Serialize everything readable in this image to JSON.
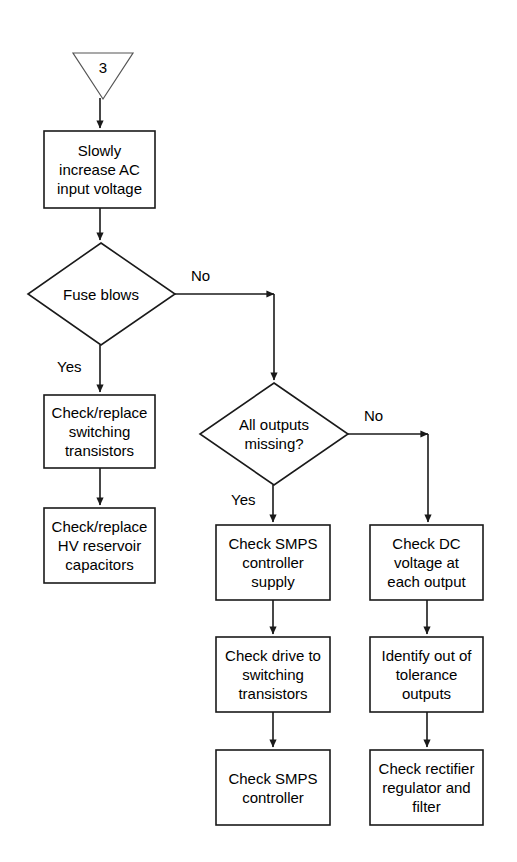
{
  "diagram": {
    "background_color": "#ffffff",
    "stroke_color": "#1a1a1a",
    "text_color": "#000000",
    "connector": {
      "name": "off-page-connector-3",
      "label": "3",
      "shape": "inverted-triangle"
    },
    "nodes": [
      {
        "id": "slowly-increase-ac",
        "type": "process",
        "label": "Slowly\nincrease AC\ninput voltage"
      },
      {
        "id": "fuse-blows",
        "type": "decision",
        "label": "Fuse blows"
      },
      {
        "id": "check-replace-switching-transistors",
        "type": "process",
        "label": "Check/replace\nswitching\ntransistors"
      },
      {
        "id": "check-replace-hv-reservoir-capacitors",
        "type": "process",
        "label": "Check/replace\nHV reservoir\ncapacitors"
      },
      {
        "id": "all-outputs-missing",
        "type": "decision",
        "label": "All outputs\nmissing?"
      },
      {
        "id": "check-smps-controller-supply",
        "type": "process",
        "label": "Check SMPS\ncontroller\nsupply"
      },
      {
        "id": "check-drive-to-switching-transistors",
        "type": "process",
        "label": "Check drive to\nswitching\ntransistors"
      },
      {
        "id": "check-smps-controller",
        "type": "process",
        "label": "Check SMPS\ncontroller"
      },
      {
        "id": "check-dc-voltage-at-each-output",
        "type": "process",
        "label": "Check DC\nvoltage at\neach output"
      },
      {
        "id": "identify-out-of-tolerance-outputs",
        "type": "process",
        "label": "Identify out of\ntolerance\noutputs"
      },
      {
        "id": "check-rectifier-regulator-and-filter",
        "type": "process",
        "label": "Check rectifier\nregulator and\nfilter"
      }
    ],
    "edge_labels": {
      "fuse_blows_no": "No",
      "fuse_blows_yes": "Yes",
      "all_outputs_no": "No",
      "all_outputs_yes": "Yes"
    }
  }
}
